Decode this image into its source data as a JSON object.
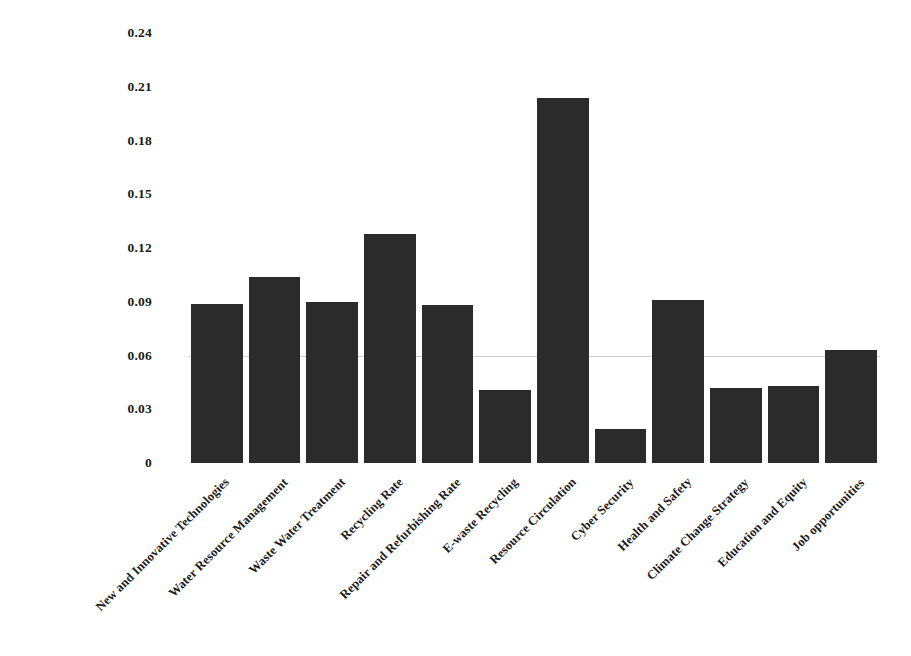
{
  "chart_data": {
    "type": "bar",
    "title": "",
    "subtitle": "",
    "xlabel": "",
    "ylabel": "",
    "ylim": [
      0,
      0.24
    ],
    "grid": true,
    "legend": false,
    "legend_position": "none",
    "bar_color": "#2b2b2b",
    "categories": [
      "New and Innovative Technologies",
      "Water Resource Management",
      "Waste Water Treatment",
      "Recycling Rate",
      "Repair and Refurbishing Rate",
      "E-waste Recycling",
      "Resource Circulation",
      "Cyber Security",
      "Health and Safety",
      "Climate Change Strategy",
      "Education and Equity",
      "Job opportunities"
    ],
    "values": [
      0.089,
      0.104,
      0.09,
      0.128,
      0.088,
      0.041,
      0.204,
      0.019,
      0.091,
      0.042,
      0.043,
      0.063
    ],
    "ytick_labels": [
      "0.24",
      "0.21",
      "0.18",
      "0.15",
      "0.12",
      "0.09",
      "0.06",
      "0.03",
      "0"
    ],
    "ytick_values": [
      0.24,
      0.21,
      0.18,
      0.15,
      0.12,
      0.09,
      0.06,
      0.03,
      0
    ]
  }
}
